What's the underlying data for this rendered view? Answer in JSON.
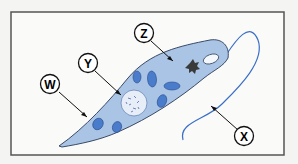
{
  "diagram": {
    "labels": [
      {
        "id": "W",
        "text": "W",
        "points_to": "cell membrane"
      },
      {
        "id": "X",
        "text": "X",
        "points_to": "flagellum"
      },
      {
        "id": "Y",
        "text": "Y",
        "points_to": "nucleus"
      },
      {
        "id": "Z",
        "text": "Z",
        "points_to": "cytoplasm"
      }
    ],
    "colors": {
      "background": "#f4f4f2",
      "frame": "#555555",
      "cell_fill": "#a9c4e4",
      "cell_outline": "#3a4a66",
      "chloroplast": "#4a7ccc",
      "nucleus_fill": "#e8eef8",
      "flagellum": "#3a6fc8",
      "eyespot": "#3a3a3a"
    }
  }
}
